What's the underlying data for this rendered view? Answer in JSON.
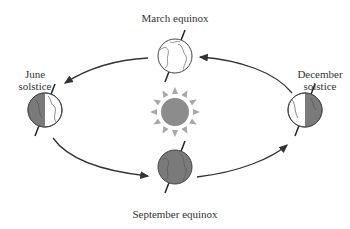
{
  "diagram": {
    "type": "earth-orbit-seasons",
    "center": {
      "label": "",
      "icon": "sun-icon",
      "color": "#8a8a8a"
    },
    "positions": [
      {
        "id": "march",
        "label_line1": "March equinox",
        "label_line2": "",
        "lit": "full"
      },
      {
        "id": "june",
        "label_line1": "June",
        "label_line2": "solstice",
        "lit": "right-half"
      },
      {
        "id": "september",
        "label_line1": "September equinox",
        "label_line2": "",
        "lit": "none"
      },
      {
        "id": "december",
        "label_line1": "December",
        "label_line2": "solstice",
        "lit": "left-half"
      }
    ],
    "arrows": [
      {
        "from": "march",
        "to": "june"
      },
      {
        "from": "june",
        "to": "september"
      },
      {
        "from": "september",
        "to": "december"
      },
      {
        "from": "december",
        "to": "march"
      }
    ],
    "colors": {
      "shadow": "#7a7a7a",
      "outline": "#444444",
      "arrow": "#333333",
      "sun": "#8c8c8c"
    }
  }
}
